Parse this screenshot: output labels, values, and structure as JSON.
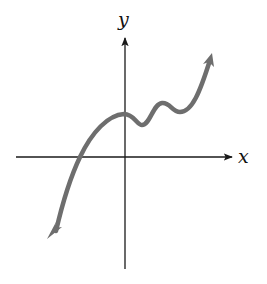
{
  "figure": {
    "axes": {
      "x_label": "x",
      "y_label": "y",
      "axis_color": "#1a1a1a"
    },
    "curve": {
      "color": "#6e6e6e",
      "end_behavior_left": "down",
      "end_behavior_right": "up"
    }
  }
}
